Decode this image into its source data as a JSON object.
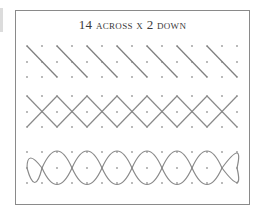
{
  "diagram": {
    "title": "14 across x 2 down",
    "colors": {
      "frame": "#8a8a8a",
      "line": "#808080",
      "dot": "#9a9a9a",
      "text": "#3a3a3a"
    },
    "grid": {
      "columns": 15,
      "x_start": 27,
      "x_step": 15,
      "rows": [
        {
          "name": "diagonal-stitch",
          "y": [
            46,
            62,
            77
          ]
        },
        {
          "name": "diamond-chain",
          "y": [
            96,
            112,
            127
          ]
        },
        {
          "name": "scallop-chain",
          "y": [
            152,
            168,
            183
          ]
        }
      ]
    }
  }
}
